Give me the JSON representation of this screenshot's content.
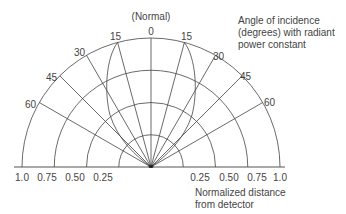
{
  "diagram": {
    "title_normal": "(Normal)",
    "annotation_angle": [
      "Angle of incidence",
      "(degrees) with radiant",
      "power constant"
    ],
    "annotation_distance": [
      "Normalized distance",
      "from detector"
    ],
    "angle_labels": {
      "a0": "0",
      "l15": "15",
      "l30": "30",
      "l45": "45",
      "l60": "60",
      "r15": "15",
      "r30": "30",
      "r45": "45",
      "r60": "60"
    },
    "distance_labels": {
      "left": [
        "1.0",
        "0.75",
        "0.50",
        "0.25"
      ],
      "right": [
        "0.25",
        "0.50",
        "0.75",
        "1.0"
      ]
    },
    "angles_deg": [
      0,
      15,
      30,
      45,
      60
    ],
    "radii_normalized": [
      0.25,
      0.5,
      0.75,
      1.0
    ],
    "colors": {
      "line": "#444444",
      "text": "#444444",
      "background": "#ffffff"
    }
  }
}
